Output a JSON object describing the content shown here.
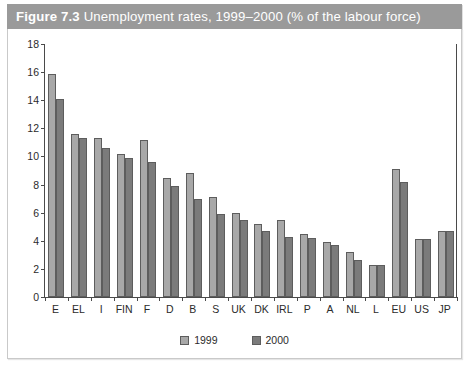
{
  "figure": {
    "number": "Figure 7.3",
    "caption": "Unemployment rates, 1999–2000 (% of the labour force)"
  },
  "legend": {
    "items": [
      {
        "label": "1999",
        "color": "#a8a8a8",
        "name": "legend-swatch-1999"
      },
      {
        "label": "2000",
        "color": "#7b7b7b",
        "name": "legend-swatch-2000"
      }
    ]
  },
  "chart_data": {
    "type": "bar",
    "title": "Unemployment rates, 1999–2000 (% of the labour force)",
    "xlabel": "",
    "ylabel": "",
    "ylim": [
      0,
      18
    ],
    "yticks": [
      0,
      2,
      4,
      6,
      8,
      10,
      12,
      14,
      16,
      18
    ],
    "grid": false,
    "legend_position": "bottom-center",
    "categories": [
      "E",
      "EL",
      "I",
      "FIN",
      "F",
      "D",
      "B",
      "S",
      "UK",
      "DK",
      "IRL",
      "P",
      "A",
      "NL",
      "L",
      "EU",
      "US",
      "JP"
    ],
    "series": [
      {
        "name": "1999",
        "color": "#a8a8a8",
        "values": [
          15.9,
          11.6,
          11.3,
          10.2,
          11.2,
          8.5,
          8.8,
          7.1,
          6.0,
          5.2,
          5.5,
          4.5,
          3.9,
          3.2,
          2.3,
          9.1,
          4.1,
          4.7
        ]
      },
      {
        "name": "2000",
        "color": "#7b7b7b",
        "values": [
          14.1,
          11.3,
          10.6,
          9.9,
          9.6,
          7.9,
          7.0,
          5.9,
          5.5,
          4.7,
          4.3,
          4.2,
          3.7,
          2.6,
          2.3,
          8.2,
          4.1,
          4.7
        ]
      }
    ]
  }
}
